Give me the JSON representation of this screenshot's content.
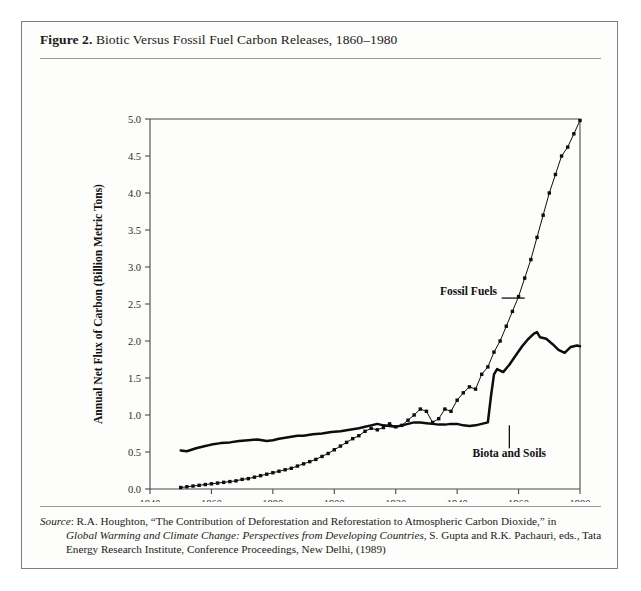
{
  "figure": {
    "number_label": "Figure 2.",
    "title": " Biotic Versus Fossil Fuel Carbon Releases, 1860–1980"
  },
  "source": {
    "label": "Source",
    "line1_rest": ": R.A. Houghton, “The Contribution of Deforestation and Reforestation to Atmospheric Carbon Dioxide,” in",
    "line2_italic": "Global Warming and Climate Change: Perspectives from Developing Countries",
    "line2_rest": ", S. Gupta and R.K. Pachauri, eds., Tata",
    "line3": "Energy Research Institute, Conference Proceedings, New Delhi, (1989)"
  },
  "chart_data": {
    "type": "line",
    "title": "Biotic Versus Fossil Fuel Carbon Releases, 1860–1980",
    "xlabel": "",
    "ylabel": "Annual Net Flux of Carbon (Billion Metric Tons)",
    "xlim": [
      1840,
      1980
    ],
    "ylim": [
      0.0,
      5.0
    ],
    "xticks": [
      1840,
      1860,
      1880,
      1900,
      1920,
      1940,
      1960,
      1980
    ],
    "xtick_labels": [
      "1840",
      "1860",
      "1880",
      "1900",
      "1920",
      "1940",
      "1960",
      "1980"
    ],
    "yticks": [
      0.0,
      0.5,
      1.0,
      1.5,
      2.0,
      2.5,
      3.0,
      3.5,
      4.0,
      4.5,
      5.0
    ],
    "ytick_labels": [
      "0.0",
      "0.5",
      "1.0",
      "1.5",
      "2.0",
      "2.5",
      "3.0",
      "3.5",
      "4.0",
      "4.5",
      "5.0"
    ],
    "grid": false,
    "legend": "inline-annotations",
    "series": [
      {
        "name": "Biota and Soils",
        "style": "solid",
        "annotation_label": "Biota and Soils",
        "x": [
          1850,
          1852,
          1855,
          1858,
          1860,
          1863,
          1866,
          1869,
          1872,
          1875,
          1878,
          1880,
          1882,
          1885,
          1888,
          1890,
          1893,
          1896,
          1899,
          1902,
          1905,
          1908,
          1910,
          1912,
          1914,
          1916,
          1918,
          1920,
          1922,
          1924,
          1926,
          1928,
          1930,
          1932,
          1934,
          1936,
          1938,
          1940,
          1942,
          1944,
          1946,
          1948,
          1950,
          1951,
          1952,
          1953,
          1955,
          1957,
          1959,
          1961,
          1963,
          1965,
          1966,
          1967,
          1969,
          1971,
          1973,
          1975,
          1977,
          1979,
          1980
        ],
        "y": [
          0.52,
          0.51,
          0.55,
          0.58,
          0.6,
          0.62,
          0.63,
          0.65,
          0.66,
          0.67,
          0.65,
          0.66,
          0.68,
          0.7,
          0.72,
          0.72,
          0.74,
          0.75,
          0.77,
          0.78,
          0.8,
          0.82,
          0.84,
          0.86,
          0.88,
          0.86,
          0.85,
          0.84,
          0.86,
          0.88,
          0.9,
          0.9,
          0.89,
          0.88,
          0.87,
          0.87,
          0.88,
          0.88,
          0.86,
          0.85,
          0.86,
          0.88,
          0.9,
          1.25,
          1.55,
          1.62,
          1.58,
          1.68,
          1.8,
          1.92,
          2.02,
          2.1,
          2.12,
          2.05,
          2.03,
          1.96,
          1.88,
          1.84,
          1.92,
          1.94,
          1.93
        ]
      },
      {
        "name": "Fossil Fuels",
        "style": "dotted",
        "annotation_label": "Fossil Fuels",
        "x": [
          1850,
          1852,
          1854,
          1856,
          1858,
          1860,
          1862,
          1864,
          1866,
          1868,
          1870,
          1872,
          1874,
          1876,
          1878,
          1880,
          1882,
          1884,
          1886,
          1888,
          1890,
          1892,
          1894,
          1896,
          1898,
          1900,
          1902,
          1904,
          1906,
          1908,
          1910,
          1912,
          1914,
          1916,
          1918,
          1920,
          1922,
          1924,
          1926,
          1928,
          1930,
          1932,
          1934,
          1936,
          1938,
          1940,
          1942,
          1944,
          1946,
          1948,
          1950,
          1952,
          1954,
          1956,
          1958,
          1960,
          1962,
          1964,
          1966,
          1968,
          1970,
          1972,
          1974,
          1976,
          1978,
          1980
        ],
        "y": [
          0.02,
          0.03,
          0.04,
          0.05,
          0.06,
          0.07,
          0.08,
          0.09,
          0.1,
          0.11,
          0.13,
          0.14,
          0.16,
          0.18,
          0.2,
          0.22,
          0.24,
          0.26,
          0.28,
          0.31,
          0.34,
          0.37,
          0.4,
          0.44,
          0.48,
          0.53,
          0.58,
          0.63,
          0.68,
          0.72,
          0.78,
          0.82,
          0.8,
          0.83,
          0.88,
          0.84,
          0.86,
          0.93,
          1.0,
          1.08,
          1.05,
          0.9,
          0.95,
          1.08,
          1.05,
          1.2,
          1.3,
          1.38,
          1.35,
          1.55,
          1.65,
          1.85,
          2.0,
          2.2,
          2.4,
          2.6,
          2.85,
          3.1,
          3.4,
          3.7,
          4.0,
          4.25,
          4.5,
          4.62,
          4.8,
          4.98
        ]
      }
    ]
  },
  "plot_geometry": {
    "left": 128,
    "right": 558,
    "top": 53,
    "bottom": 423
  }
}
